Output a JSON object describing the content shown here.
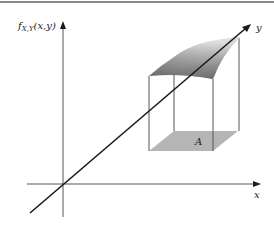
{
  "diagram": {
    "type": "3d-axes-joint-density",
    "labels": {
      "vertical_axis_f": "f",
      "vertical_axis_sub": "X,Y",
      "vertical_axis_args": "(x,y)",
      "x_axis": "x",
      "y_axis": "y",
      "region": "A"
    },
    "colors": {
      "axis": "#555555",
      "diagonal_axis": "#1a1a1a",
      "top_border": "#8a8a8a",
      "region_fill": "#b5b5b5",
      "surface_dark": "#5a5a5a",
      "surface_light": "#f2f2f2",
      "box_lines": "#555555"
    }
  }
}
